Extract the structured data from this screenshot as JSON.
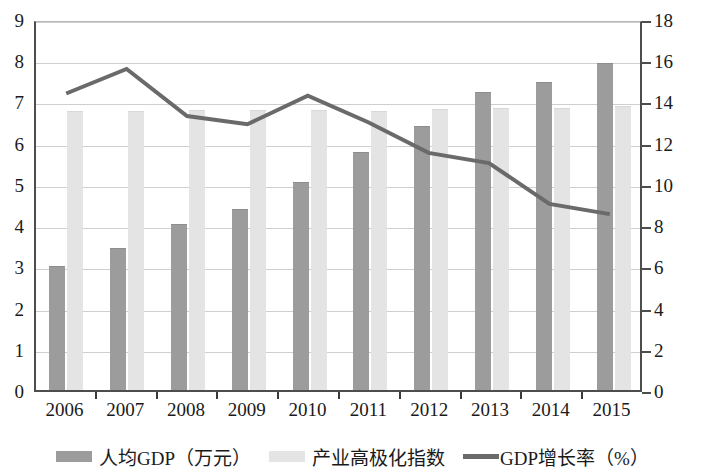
{
  "chart_data": {
    "type": "bar",
    "title": "",
    "subtitle": "",
    "xlabel": "",
    "ylabel": "",
    "categories": [
      "2006",
      "2007",
      "2008",
      "2009",
      "2010",
      "2011",
      "2012",
      "2013",
      "2014",
      "2015"
    ],
    "left_axis": {
      "label": "",
      "min": 0,
      "max": 9,
      "step": 1,
      "ticks": [
        "0",
        "1",
        "2",
        "3",
        "4",
        "5",
        "6",
        "7",
        "8",
        "9"
      ],
      "grid": true
    },
    "right_axis": {
      "label": "",
      "min": 0,
      "max": 18,
      "step": 2,
      "ticks": [
        "0",
        "2",
        "4",
        "6",
        "8",
        "10",
        "12",
        "14",
        "16",
        "18"
      ],
      "grid": false
    },
    "series": [
      {
        "name": "人均GDP（万元）",
        "type": "bar",
        "axis": "left",
        "color": "#9c9c9c",
        "values": [
          3.0,
          3.45,
          4.03,
          4.4,
          5.05,
          5.78,
          6.4,
          7.22,
          7.47,
          7.93
        ]
      },
      {
        "name": "产业高极化指数",
        "type": "bar",
        "axis": "left",
        "color": "#e4e4e4",
        "values": [
          6.78,
          6.78,
          6.8,
          6.8,
          6.8,
          6.78,
          6.82,
          6.85,
          6.85,
          6.88
        ]
      },
      {
        "name": "GDP增长率（%）",
        "type": "line",
        "axis": "right",
        "color": "#6a6a6a",
        "values": [
          14.5,
          15.7,
          13.4,
          13.0,
          14.4,
          13.1,
          11.6,
          11.1,
          9.1,
          8.6
        ]
      }
    ],
    "legend": {
      "position": "bottom",
      "entries": [
        {
          "label": "人均GDP（万元）",
          "marker": "square",
          "color": "#9c9c9c"
        },
        {
          "label": "产业高极化指数",
          "marker": "square",
          "color": "#e4e4e4"
        },
        {
          "label": "GDP增长率（%）",
          "marker": "line",
          "color": "#6a6a6a"
        }
      ]
    }
  }
}
